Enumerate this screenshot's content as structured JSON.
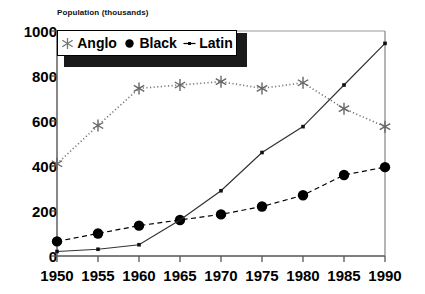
{
  "chart_data": {
    "type": "line",
    "title": "",
    "ylabel": "Population (thousands)",
    "xlabel": "",
    "x": [
      1950,
      1955,
      1960,
      1965,
      1970,
      1975,
      1980,
      1985,
      1990
    ],
    "categories": [
      "1950",
      "1955",
      "1960",
      "1965",
      "1970",
      "1975",
      "1980",
      "1985",
      "1990"
    ],
    "ylim": [
      0,
      1000
    ],
    "yticks": [
      0,
      200,
      400,
      600,
      800,
      1000
    ],
    "ytick_labels": [
      "0",
      "200",
      "400",
      "600",
      "800",
      "1000"
    ],
    "grid": false,
    "legend_position": "top-left",
    "series": [
      {
        "name": "Anglo",
        "marker": "asterisk",
        "line_style": "dotted",
        "color": "#777777",
        "values": [
          410,
          580,
          745,
          760,
          775,
          745,
          770,
          655,
          575
        ]
      },
      {
        "name": "Black",
        "marker": "circle",
        "line_style": "dashed",
        "color": "#000000",
        "values": [
          65,
          100,
          135,
          160,
          185,
          220,
          270,
          360,
          395
        ]
      },
      {
        "name": "Latin",
        "marker": "small-square",
        "line_style": "solid",
        "color": "#333333",
        "values": [
          20,
          30,
          50,
          160,
          290,
          460,
          575,
          760,
          945
        ]
      }
    ]
  },
  "legend": {
    "items": [
      {
        "label": "Anglo",
        "marker": "asterisk-marker-icon"
      },
      {
        "label": "Black",
        "marker": "circle-marker-icon"
      },
      {
        "label": "Latin",
        "marker": "dash-marker-icon"
      }
    ]
  },
  "axis": {
    "y_title": "Population (thousands)"
  }
}
